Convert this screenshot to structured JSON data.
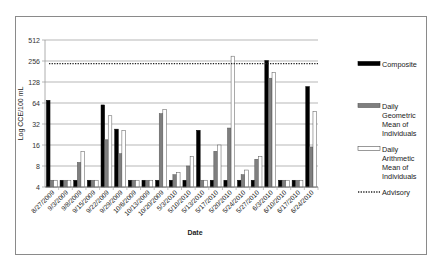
{
  "chart_data": {
    "type": "bar",
    "title": "",
    "xlabel": "Date",
    "ylabel": "Log CCE/100 mL",
    "yscale": "log2",
    "ylim": [
      4,
      512
    ],
    "yticks": [
      4,
      8,
      16,
      32,
      64,
      128,
      256,
      512
    ],
    "grid": true,
    "legend_position": "right",
    "categories": [
      "8/27/2009",
      "9/3/2009",
      "9/8/2009",
      "9/15/2009",
      "9/22/2009",
      "9/29/2009",
      "10/6/2009",
      "10/13/2009",
      "10/20/2009",
      "5/3/2010",
      "5/10/2010",
      "5/13/2010",
      "5/17/2010",
      "5/20/2010",
      "5/24/2010",
      "5/27/2010",
      "6/3/2010",
      "6/10/2010",
      "6/17/2010",
      "6/24/2010"
    ],
    "series": [
      {
        "name": "Composite",
        "color": "#000000",
        "values": [
          70,
          5,
          5,
          5,
          60,
          27,
          5,
          5,
          5,
          5,
          5,
          26,
          5,
          5,
          5,
          5,
          260,
          5,
          5,
          110
        ]
      },
      {
        "name": "Daily Geometric Mean of Individuals",
        "color": "#7f7f7f",
        "values": [
          5,
          5,
          9,
          5,
          19,
          12,
          5,
          5,
          45,
          6,
          8,
          5,
          13,
          28,
          6,
          10,
          145,
          5,
          5,
          15
        ]
      },
      {
        "name": "Daily Arithmetic Mean of Individuals",
        "color": "#ffffff",
        "values": [
          5,
          5,
          13,
          5,
          42,
          26,
          5,
          5,
          52,
          6.5,
          11,
          5,
          16,
          300,
          7,
          11,
          175,
          5,
          5,
          48
        ]
      }
    ],
    "reference_lines": [
      {
        "name": "Advisory",
        "value": 235,
        "style": "dotted"
      }
    ]
  },
  "legend": {
    "items": [
      {
        "label_lines": [
          "Composite"
        ]
      },
      {
        "label_lines": [
          "Daily",
          "Geometric",
          "Mean of",
          "Individuals"
        ]
      },
      {
        "label_lines": [
          "Daily",
          "Arithmetic",
          "Mean of",
          "Individuals"
        ]
      },
      {
        "label_lines": [
          "Advisory"
        ]
      }
    ]
  }
}
